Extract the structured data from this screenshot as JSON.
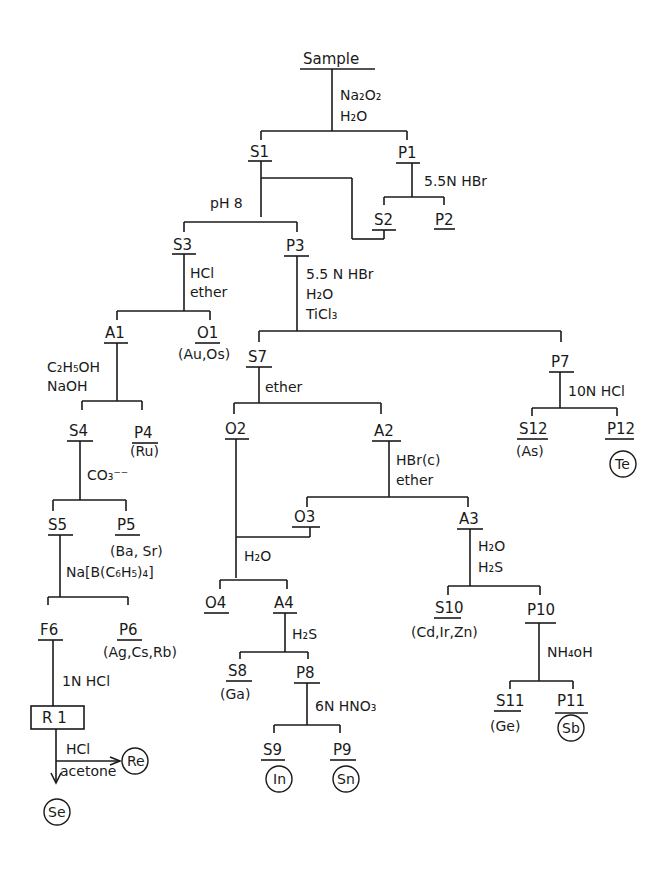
{
  "diagram": {
    "nodes": {
      "sample": "Sample",
      "s1": "S1",
      "p1": "P1",
      "s2": "S2",
      "p2": "P2",
      "s3": "S3",
      "p3": "P3",
      "a1": "A1",
      "o1": "O1",
      "o1_elements": "(Au,Os)",
      "s4": "S4",
      "p4": "P4",
      "p4_elements": "(Ru)",
      "s5": "S5",
      "p5": "P5",
      "p5_elements": "(Ba, Sr)",
      "f6": "F6",
      "p6": "P6",
      "p6_elements": "(Ag,Cs,Rb)",
      "r1": "R 1",
      "re": "Re",
      "se": "Se",
      "s7": "S7",
      "p7": "P7",
      "o2": "O2",
      "a2": "A2",
      "o3": "O3",
      "a3": "A3",
      "o4": "O4",
      "a4": "A4",
      "s8": "S8",
      "s8_elements": "(Ga)",
      "p8": "P8",
      "s9": "S9",
      "s9_element": "In",
      "p9": "P9",
      "p9_element": "Sn",
      "s10": "S10",
      "s10_elements": "(Cd,Ir,Zn)",
      "p10": "P10",
      "s11": "S11",
      "s11_elements": "(Ge)",
      "p11": "P11",
      "p11_element": "Sb",
      "s12": "S12",
      "s12_elements": "(As)",
      "p12": "P12",
      "p12_element": "Te"
    },
    "reagents": {
      "sample_1": "Na₂O₂",
      "sample_2": "H₂O",
      "p1": "5.5N  HBr",
      "s1": "pH 8",
      "s3_1": "HCl",
      "s3_2": "ether",
      "p3_1": "5.5 N  HBr",
      "p3_2": "H₂O",
      "p3_3": "TiCl₃",
      "a1_1": "C₂H₅OH",
      "a1_2": "NaOH",
      "s4": "CO₃⁻⁻",
      "s5": "Na[B(C₆H₅)₄]",
      "f6": "1N  HCl",
      "r1_1": "HCl",
      "r1_2": "acetone",
      "s7": "ether",
      "p7": "10N  HCl",
      "a2_1": "HBr(c)",
      "a2_2": "ether",
      "o3": "H₂O",
      "a3_1": "H₂O",
      "a3_2": "H₂S",
      "a4": "H₂S",
      "p8": "6N  HNO₃",
      "p10": "NH₄oH"
    }
  }
}
